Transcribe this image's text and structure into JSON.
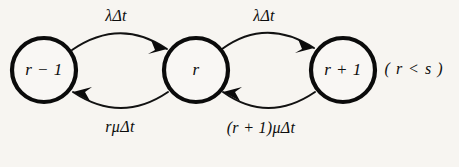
{
  "figure": {
    "type": "state-transition-diagram",
    "background_color": "#f7f5f1",
    "ink_color": "#0b0b0b",
    "width": 459,
    "height": 167,
    "condition": "( r < s )"
  },
  "states": [
    {
      "id": "r-minus-1",
      "label": "r − 1",
      "cx": 44,
      "cy": 70,
      "radius": 32
    },
    {
      "id": "r",
      "label": "r",
      "cx": 196,
      "cy": 70,
      "radius": 32
    },
    {
      "id": "r-plus-1",
      "label": "r + 1",
      "cx": 343,
      "cy": 70,
      "radius": 32
    }
  ],
  "transitions": [
    {
      "id": "birth-left",
      "from": "r-minus-1",
      "to": "r",
      "direction": "forward",
      "position": "top",
      "label": "λΔt",
      "label_x": 116,
      "label_y": 17
    },
    {
      "id": "death-left",
      "from": "r",
      "to": "r-minus-1",
      "direction": "backward",
      "position": "bottom",
      "label": "rμΔt",
      "label_x": 120,
      "label_y": 128
    },
    {
      "id": "birth-right",
      "from": "r",
      "to": "r-plus-1",
      "direction": "forward",
      "position": "top",
      "label": "λΔt",
      "label_x": 264,
      "label_y": 17
    },
    {
      "id": "death-right",
      "from": "r-plus-1",
      "to": "r",
      "direction": "backward",
      "position": "bottom",
      "label": "(r + 1)μΔt",
      "label_x": 261,
      "label_y": 129
    }
  ],
  "annotation": {
    "id": "range-condition",
    "text": "( r < s )",
    "x": 414,
    "y": 70
  }
}
